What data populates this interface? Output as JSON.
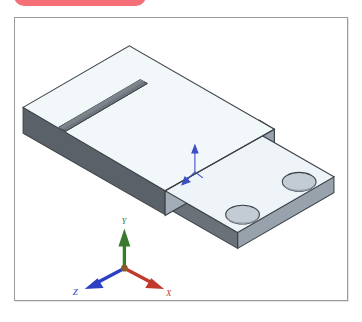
{
  "banner": {
    "text": "Solution",
    "icon": "info-circle-icon",
    "color": "#f4636b"
  },
  "viewport": {
    "background": "#ffffff",
    "border_color": "#9b9b9b"
  },
  "model": {
    "name": "stepped-bracket-plate",
    "description": "Isometric CAD view of an L-shaped stepped plate with a through-slot on the raised block and two circular holes on the lower flange",
    "features": [
      {
        "name": "raised-block",
        "detail": "rectangular raised boss, upper-left"
      },
      {
        "name": "through-slot",
        "detail": "elongated rectangular slot on raised block top face"
      },
      {
        "name": "lower-flange",
        "detail": "thin stepped flange, lower-right"
      },
      {
        "name": "hole-front",
        "detail": "circular through hole, left of flange"
      },
      {
        "name": "hole-rear",
        "detail": "circular through hole, right of flange"
      }
    ],
    "colors": {
      "top_face": "#f2f7fa",
      "top_face_2": "#e8eef2",
      "right_face": "#98a2ad",
      "front_face": "#5b6168",
      "front_face_dark": "#4e545b",
      "slot_inner": "#6e757d",
      "hole_inner": "#b9c2cb",
      "edge": "#3c4248"
    }
  },
  "origin_marker": {
    "name": "origin-triad",
    "color": "#3b4fc4"
  },
  "coordinate_triad": {
    "x": {
      "label": "X",
      "color": "#c0392b"
    },
    "y": {
      "label": "Y",
      "color": "#3a7a2e"
    },
    "z": {
      "label": "Z",
      "color": "#2b3fc4"
    }
  }
}
